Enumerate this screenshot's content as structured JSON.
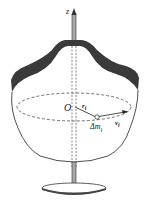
{
  "diagram": {
    "labels": {
      "axis": "z",
      "origin": "O",
      "radius": "r",
      "radius_sub": "i",
      "mass": "Δm",
      "mass_sub": "i",
      "velocity": "v",
      "velocity_sub": "i"
    },
    "colors": {
      "outline": "#222222",
      "shaded_band": "#3a3a3a",
      "axis_rod": "#9a9a9a",
      "base": "#555555"
    }
  }
}
